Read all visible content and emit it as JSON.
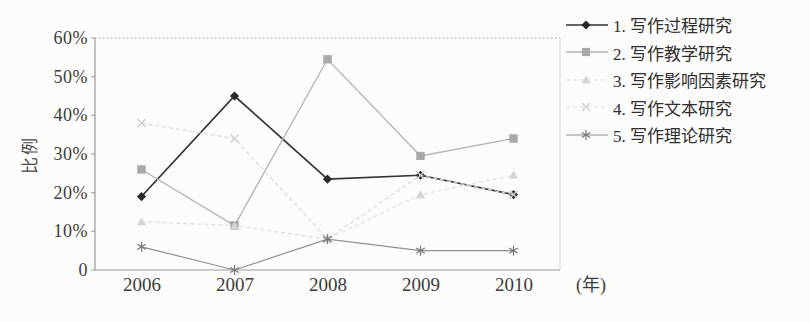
{
  "figure": {
    "y_axis_title": "比例",
    "x_axis_unit": "(年)"
  },
  "colors": {
    "axis": "#9a9a9a",
    "frame_right": "#d6d6d6",
    "background": "#fcfcfa",
    "text": "#3c3c3c"
  },
  "chart_data": {
    "type": "line",
    "title": "",
    "xlabel": "(年)",
    "ylabel": "比例",
    "categories": [
      "2006",
      "2007",
      "2008",
      "2009",
      "2010"
    ],
    "yticks": [
      "0",
      "10%",
      "20%",
      "30%",
      "40%",
      "50%",
      "60%"
    ],
    "ylim": [
      0,
      60
    ],
    "grid": "top-gridline-dotted-only",
    "legend_position": "right",
    "series": [
      {
        "name": "1. 写作过程研究",
        "values": [
          19,
          45,
          23.5,
          24.5,
          19.5
        ],
        "marker": "diamond",
        "color": "#343434",
        "marker_color": "#2a2a2a",
        "width": 1.7,
        "dash": ""
      },
      {
        "name": "2. 写作教学研究",
        "values": [
          26,
          11.5,
          54.5,
          29.5,
          34
        ],
        "marker": "square",
        "color": "#b3b3b3",
        "marker_color": "#a9a9a9",
        "width": 1.3,
        "dash": ""
      },
      {
        "name": "3. 写作影响因素研究",
        "values": [
          12.5,
          11.5,
          8,
          19.5,
          24.5
        ],
        "marker": "triangle",
        "color": "#dedede",
        "marker_color": "#d4d4d4",
        "width": 1.2,
        "dash": "4,3"
      },
      {
        "name": "4. 写作文本研究",
        "values": [
          38,
          34,
          8,
          24.5,
          19.5
        ],
        "marker": "x",
        "color": "#d9d9d9",
        "marker_color": "#cfcfcf",
        "width": 1.2,
        "dash": "4,3"
      },
      {
        "name": "5. 写作理论研究",
        "values": [
          6,
          0,
          8,
          5,
          5
        ],
        "marker": "asterisk",
        "color": "#8f8f8f",
        "marker_color": "#777777",
        "width": 1.2,
        "dash": ""
      }
    ]
  }
}
